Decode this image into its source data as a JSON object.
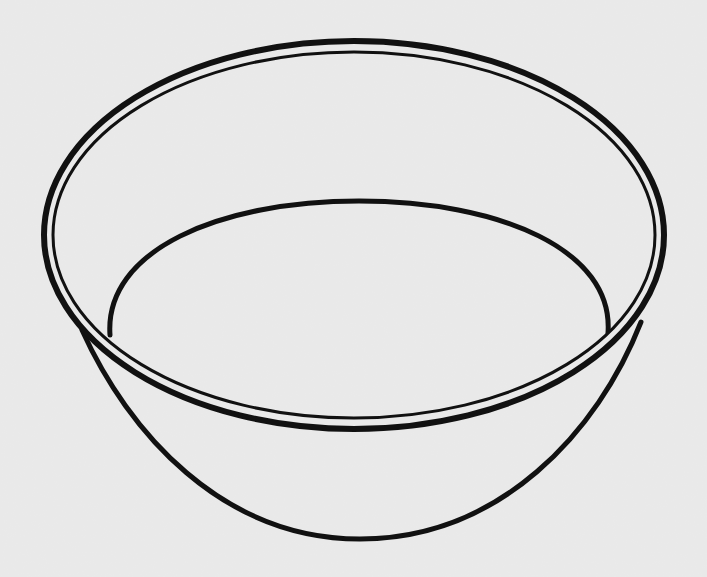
{
  "image": {
    "subject": "Line drawing of an empty round bowl",
    "style": "black outline on light gray paper texture",
    "colors": {
      "background": "#e9e9e9",
      "paper_speckle": "#dcdcdc",
      "ink": "#111111"
    }
  },
  "shapes": {
    "rim_outer": {
      "cx": 354,
      "cy": 235,
      "rx": 310,
      "ry": 194,
      "stroke": 6
    },
    "rim_inner": {
      "cx": 354,
      "cy": 235,
      "rx": 301,
      "ry": 183,
      "stroke": 3
    },
    "bowl_interior": {
      "left": [
        110,
        333
      ],
      "right": [
        608,
        333
      ],
      "top_y": 201,
      "stroke": 5
    },
    "bowl_body": {
      "left": [
        82,
        330
      ],
      "right": [
        640,
        330
      ],
      "bottom_y": 539,
      "stroke": 5
    }
  }
}
